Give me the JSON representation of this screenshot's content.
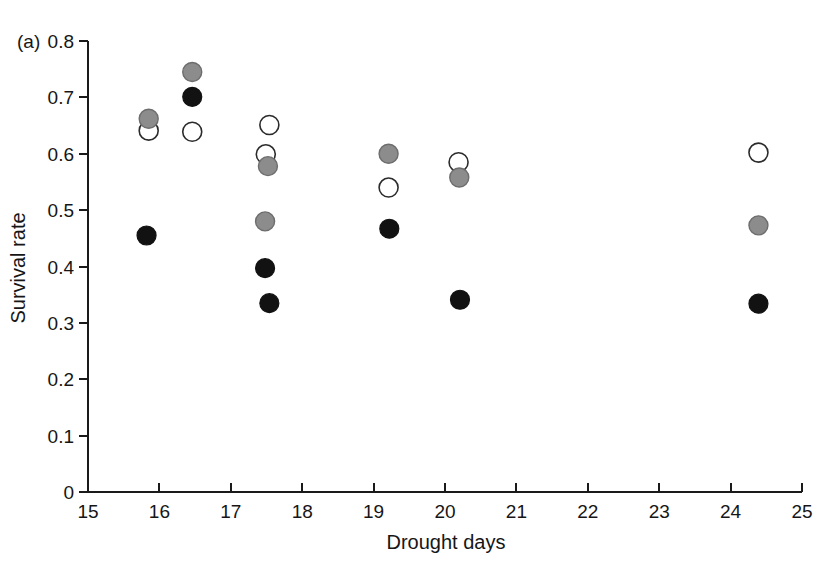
{
  "figure": {
    "panel_label": "(a)",
    "background": "#ffffff"
  },
  "chart_data": {
    "type": "scatter",
    "title": "",
    "xlabel": "Drought days",
    "ylabel": "Survival rate",
    "xlim": [
      15,
      25
    ],
    "ylim": [
      0,
      0.8
    ],
    "xticks": [
      15,
      16,
      17,
      18,
      19,
      20,
      21,
      22,
      23,
      24,
      25
    ],
    "xtick_labels": [
      "15",
      "16",
      "17",
      "18",
      "19",
      "20",
      "21",
      "22",
      "23",
      "24",
      "25"
    ],
    "yticks": [
      0,
      0.1,
      0.2,
      0.3,
      0.4,
      0.5,
      0.6,
      0.7,
      0.8
    ],
    "ytick_labels": [
      "0",
      "0.1",
      "0.2",
      "0.3",
      "0.4",
      "0.5",
      "0.6",
      "0.7",
      "0.8"
    ],
    "grid": false,
    "legend": "none",
    "marker_colors": {
      "gray": "#8c8c8c",
      "open": "#ffffff",
      "black": "#121212",
      "outline": "#2b2b2b"
    },
    "series": [
      {
        "name": "gray-filled",
        "marker": "filled-gray-circle",
        "color": "#8c8c8c",
        "points": [
          {
            "x": 15.85,
            "y": 0.662
          },
          {
            "x": 16.46,
            "y": 0.745
          },
          {
            "x": 17.52,
            "y": 0.578
          },
          {
            "x": 17.48,
            "y": 0.48
          },
          {
            "x": 19.21,
            "y": 0.6
          },
          {
            "x": 20.2,
            "y": 0.558
          },
          {
            "x": 24.39,
            "y": 0.473
          }
        ]
      },
      {
        "name": "open",
        "marker": "open-circle",
        "color": "#ffffff",
        "points": [
          {
            "x": 15.85,
            "y": 0.641
          },
          {
            "x": 16.46,
            "y": 0.639
          },
          {
            "x": 17.54,
            "y": 0.651
          },
          {
            "x": 17.49,
            "y": 0.599
          },
          {
            "x": 19.21,
            "y": 0.54
          },
          {
            "x": 20.19,
            "y": 0.585
          },
          {
            "x": 24.39,
            "y": 0.602
          }
        ]
      },
      {
        "name": "black-filled",
        "marker": "filled-black-circle",
        "color": "#121212",
        "points": [
          {
            "x": 15.82,
            "y": 0.455
          },
          {
            "x": 16.46,
            "y": 0.701
          },
          {
            "x": 17.48,
            "y": 0.397
          },
          {
            "x": 17.54,
            "y": 0.335
          },
          {
            "x": 19.22,
            "y": 0.467
          },
          {
            "x": 20.21,
            "y": 0.341
          },
          {
            "x": 24.39,
            "y": 0.334
          }
        ]
      }
    ]
  }
}
